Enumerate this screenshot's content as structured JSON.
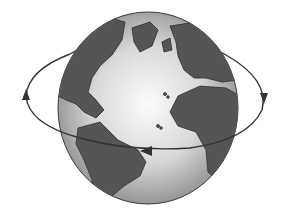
{
  "illustration": {
    "subject": "Earth globe rotating",
    "alt": "Grayscale globe showing the Atlantic Ocean, the Americas, Europe and Africa, with an elliptical arrow indicating west-to-east rotation",
    "colors": {
      "background": "#ffffff",
      "ocean_light": "#f2f2f2",
      "ocean_edge": "#9a9a9a",
      "land": "#5a5a5a",
      "outline": "#3a3a3a",
      "arrow": "#333333"
    }
  }
}
